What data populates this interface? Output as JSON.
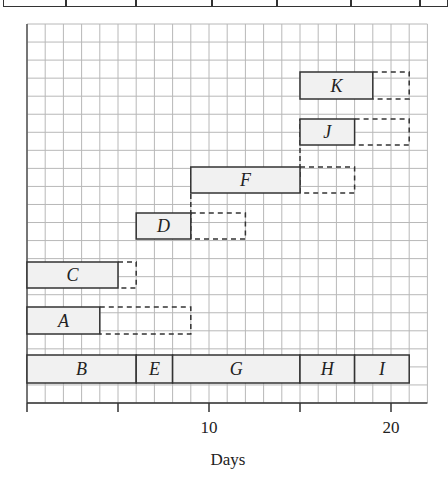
{
  "top_table": {
    "divider_x": [
      64,
      134,
      210,
      275,
      349,
      418
    ]
  },
  "chart_data": {
    "type": "gantt",
    "title": "",
    "xlabel": "Days",
    "ylabel": "",
    "xlim": [
      0,
      22
    ],
    "x_ticks": [
      0,
      5,
      10,
      15,
      20
    ],
    "x_tick_labels": [
      "",
      "",
      "10",
      "",
      "20"
    ],
    "grid": true,
    "legend": null,
    "activities": [
      {
        "name": "K",
        "start": 15,
        "end": 19,
        "float_end": 21,
        "row": 0
      },
      {
        "name": "J",
        "start": 15,
        "end": 18,
        "float_end": 21,
        "row": 1
      },
      {
        "name": "F",
        "start": 9,
        "end": 15,
        "float_end": 18,
        "row": 2
      },
      {
        "name": "D",
        "start": 6,
        "end": 9,
        "float_end": 12,
        "row": 3
      },
      {
        "name": "C",
        "start": 0,
        "end": 5,
        "float_end": 6,
        "row": 4
      },
      {
        "name": "A",
        "start": 0,
        "end": 4,
        "float_end": 9,
        "row": 5
      },
      {
        "name": "B",
        "start": 0,
        "end": 6,
        "float_end": null,
        "row": 6,
        "critical": true
      },
      {
        "name": "E",
        "start": 6,
        "end": 8,
        "float_end": null,
        "row": 6,
        "critical": true
      },
      {
        "name": "G",
        "start": 8,
        "end": 15,
        "float_end": null,
        "row": 6,
        "critical": true
      },
      {
        "name": "H",
        "start": 15,
        "end": 18,
        "float_end": null,
        "row": 6,
        "critical": true
      },
      {
        "name": "I",
        "start": 18,
        "end": 21,
        "float_end": null,
        "row": 6,
        "critical": true
      }
    ],
    "row_y": [
      [
        72,
        99
      ],
      [
        119,
        145
      ],
      [
        167,
        193
      ],
      [
        213,
        239
      ],
      [
        262,
        288
      ],
      [
        307,
        334
      ],
      [
        355,
        383
      ]
    ],
    "dashed_connectors": [
      {
        "day": 9,
        "from_row": 3,
        "to_row": 2
      },
      {
        "day": 15,
        "from_row": 2,
        "to_row": 1
      }
    ]
  },
  "colors": {
    "grid": "#b8b8b8",
    "axis": "#333333",
    "bar_fill": "#f1f1f1",
    "bar_stroke": "#333333",
    "dashed": "#333333"
  }
}
